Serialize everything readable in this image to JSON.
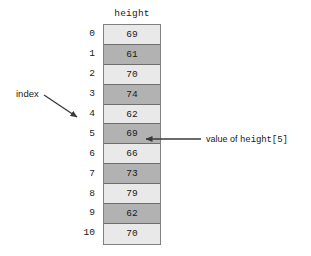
{
  "diagram": {
    "background_color": "#ffffff",
    "array": {
      "name": "height",
      "header_label": "height",
      "cell_colors": {
        "light": "#e9e9e9",
        "dark": "#b2b2b2",
        "border": "#6e6e6e"
      },
      "indices": [
        "0",
        "1",
        "2",
        "3",
        "4",
        "5",
        "6",
        "7",
        "8",
        "9",
        "10"
      ],
      "values": [
        "69",
        "61",
        "70",
        "74",
        "62",
        "69",
        "66",
        "73",
        "79",
        "62",
        "70"
      ],
      "shades": [
        "light",
        "dark",
        "light",
        "dark",
        "light",
        "dark",
        "light",
        "dark",
        "light",
        "dark",
        "light"
      ]
    },
    "annotations": {
      "index": {
        "label": "index",
        "points_to_index": "4"
      },
      "value": {
        "label_prefix": "value of ",
        "label_code": "height[5]",
        "points_to_index": "5"
      }
    }
  }
}
